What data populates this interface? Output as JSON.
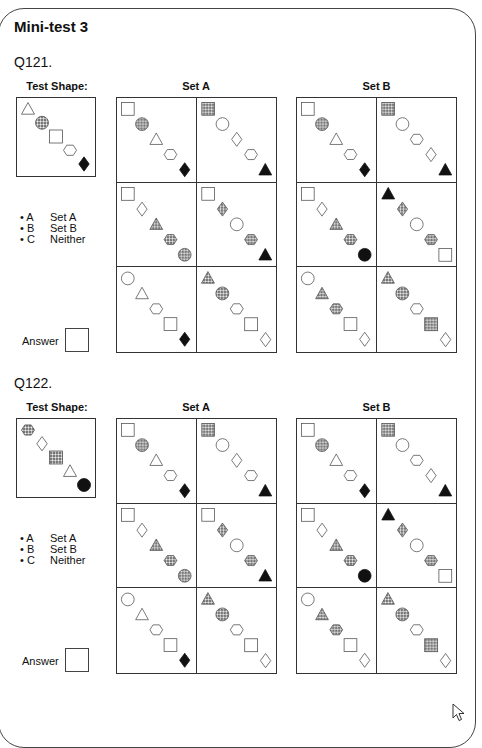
{
  "title": "Mini-test 3",
  "headers": {
    "test_shape": "Test Shape:",
    "set_a": "Set A",
    "set_b": "Set B"
  },
  "options": [
    {
      "key": "• A",
      "label": "Set A"
    },
    {
      "key": "• B",
      "label": "Set B"
    },
    {
      "key": "• C",
      "label": "Neither"
    }
  ],
  "answer_label": "Answer",
  "questions": [
    {
      "number": "Q121.",
      "test_shape": [
        "triangle-outline",
        "circle-dotted",
        "square-outline",
        "hexagon-outline",
        "diamond-black"
      ],
      "set_a": [
        [
          "square-outline",
          "circle-dotted",
          "triangle-outline",
          "hexagon-outline",
          "diamond-black"
        ],
        [
          "square-dotted",
          "circle-outline",
          "diamond-outline",
          "hexagon-outline",
          "triangle-black"
        ],
        [
          "square-outline",
          "diamond-outline",
          "triangle-dotted",
          "hexagon-dotted",
          "circle-dotted"
        ],
        [
          "square-outline",
          "diamond-dotted",
          "circle-outline",
          "hexagon-dotted",
          "triangle-black"
        ],
        [
          "circle-outline",
          "triangle-outline",
          "hexagon-outline",
          "square-outline",
          "diamond-black"
        ],
        [
          "triangle-dotted",
          "circle-dotted",
          "hexagon-outline",
          "square-outline",
          "diamond-outline"
        ]
      ],
      "set_b": [
        [
          "square-outline",
          "circle-dotted",
          "triangle-outline",
          "hexagon-outline",
          "diamond-black"
        ],
        [
          "square-dotted",
          "circle-outline",
          "hexagon-outline",
          "diamond-outline",
          "triangle-black"
        ],
        [
          "square-outline",
          "diamond-outline",
          "triangle-dotted",
          "hexagon-dotted",
          "circle-black"
        ],
        [
          "triangle-black",
          "diamond-dotted",
          "circle-outline",
          "hexagon-dotted",
          "square-outline"
        ],
        [
          "circle-outline",
          "triangle-dotted",
          "hexagon-dotted",
          "square-outline",
          "diamond-outline"
        ],
        [
          "triangle-dotted",
          "circle-dotted",
          "hexagon-outline",
          "square-dotted",
          "diamond-outline"
        ]
      ]
    },
    {
      "number": "Q122.",
      "test_shape": [
        "hexagon-dotted",
        "diamond-outline",
        "square-dotted",
        "triangle-outline",
        "circle-black"
      ],
      "set_a": [
        [
          "square-outline",
          "circle-dotted",
          "triangle-outline",
          "hexagon-outline",
          "diamond-black"
        ],
        [
          "square-dotted",
          "circle-outline",
          "diamond-outline",
          "hexagon-outline",
          "triangle-black"
        ],
        [
          "square-outline",
          "diamond-outline",
          "triangle-dotted",
          "hexagon-dotted",
          "circle-dotted"
        ],
        [
          "square-outline",
          "diamond-dotted",
          "circle-outline",
          "hexagon-dotted",
          "triangle-black"
        ],
        [
          "circle-outline",
          "triangle-outline",
          "hexagon-outline",
          "square-outline",
          "diamond-black"
        ],
        [
          "triangle-dotted",
          "circle-dotted",
          "hexagon-outline",
          "square-outline",
          "diamond-outline"
        ]
      ],
      "set_b": [
        [
          "square-outline",
          "circle-dotted",
          "triangle-outline",
          "hexagon-outline",
          "diamond-black"
        ],
        [
          "square-dotted",
          "circle-outline",
          "hexagon-outline",
          "diamond-outline",
          "triangle-black"
        ],
        [
          "square-outline",
          "diamond-outline",
          "triangle-dotted",
          "hexagon-dotted",
          "circle-black"
        ],
        [
          "triangle-black",
          "diamond-dotted",
          "circle-outline",
          "hexagon-dotted",
          "square-outline"
        ],
        [
          "circle-outline",
          "triangle-dotted",
          "hexagon-dotted",
          "square-outline",
          "diamond-outline"
        ],
        [
          "triangle-dotted",
          "circle-dotted",
          "hexagon-outline",
          "square-dotted",
          "diamond-outline"
        ]
      ]
    }
  ]
}
